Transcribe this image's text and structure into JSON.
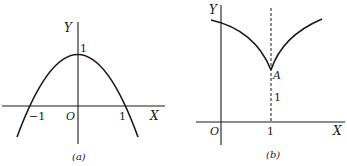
{
  "colors": {
    "ink": "#1a1a1a",
    "background": "#ffffff"
  },
  "panel_a": {
    "caption": "(a)",
    "x_axis_label": "X",
    "y_axis_label": "Y",
    "origin_label": "O",
    "tick_neg_one": "−1",
    "tick_pos_one": "1",
    "y_intercept_label": "1",
    "curve": "downward parabola through (−1,0), (0,1), (1,0)"
  },
  "panel_b": {
    "caption": "(b)",
    "x_axis_label": "X",
    "y_axis_label": "Y",
    "origin_label": "O",
    "tick_x_one": "1",
    "point_label": "A",
    "dashed_height_label": "1",
    "curve": "cusp at A = (1,1) with dashed vertical line x = 1"
  }
}
